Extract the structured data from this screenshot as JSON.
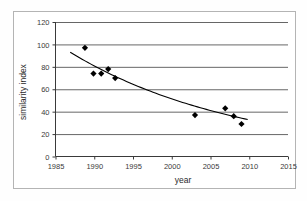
{
  "chart_data": {
    "type": "scatter",
    "title": "",
    "xlabel": "year",
    "ylabel": "similarity index",
    "xlim": [
      1985,
      2015
    ],
    "ylim": [
      0,
      120
    ],
    "xticks": [
      1985,
      1990,
      1995,
      2000,
      2005,
      2010,
      2015
    ],
    "yticks": [
      0,
      20,
      40,
      60,
      80,
      100,
      120
    ],
    "grid": "horizontal",
    "legend": "none",
    "marker": "filled-diamond",
    "marker_color": "#000000",
    "trendline": {
      "present": true,
      "type": "exponential-decay",
      "color": "#000000",
      "x_start": 1986.9,
      "x_end": 2009.8,
      "y_start": 93,
      "y_end": 33
    },
    "series": [
      {
        "name": "similarity index",
        "points": [
          {
            "x": 1988.8,
            "y": 97
          },
          {
            "x": 1989.9,
            "y": 74
          },
          {
            "x": 1990.9,
            "y": 74
          },
          {
            "x": 1991.8,
            "y": 78
          },
          {
            "x": 1992.7,
            "y": 70
          },
          {
            "x": 2003.0,
            "y": 37
          },
          {
            "x": 2006.9,
            "y": 43
          },
          {
            "x": 2008.0,
            "y": 36
          },
          {
            "x": 2009.0,
            "y": 29
          }
        ]
      }
    ]
  },
  "axes": {
    "x_title": "year",
    "y_title": "similarity index",
    "x_tick_labels": [
      "1985",
      "1990",
      "1995",
      "2000",
      "2005",
      "2010",
      "2015"
    ],
    "y_tick_labels": [
      "0",
      "20",
      "40",
      "60",
      "80",
      "100",
      "120"
    ]
  },
  "colors": {
    "frame": "#b4b4b4",
    "gridline": "#555555",
    "axis": "#3a3a3a",
    "marker": "#000000",
    "trendline": "#000000",
    "background": "#ffffff"
  }
}
